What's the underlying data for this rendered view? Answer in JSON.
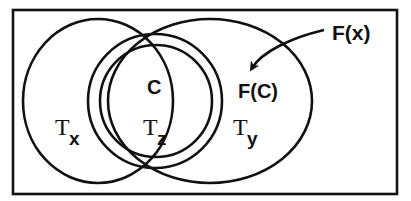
{
  "diagram": {
    "type": "venn",
    "colors": {
      "stroke": "#111111",
      "background": "#ffffff"
    },
    "sets": [
      {
        "id": "Tx",
        "label_main": "T",
        "label_sub": "x"
      },
      {
        "id": "Ty",
        "label_main": "T",
        "label_sub": "y"
      },
      {
        "id": "Tz",
        "label_main": "T",
        "label_sub": "z"
      }
    ],
    "inner_labels": {
      "c": "C",
      "fc": "F(C)"
    },
    "callout": {
      "label": "F(x)",
      "arrow_target": "F(C)"
    }
  }
}
